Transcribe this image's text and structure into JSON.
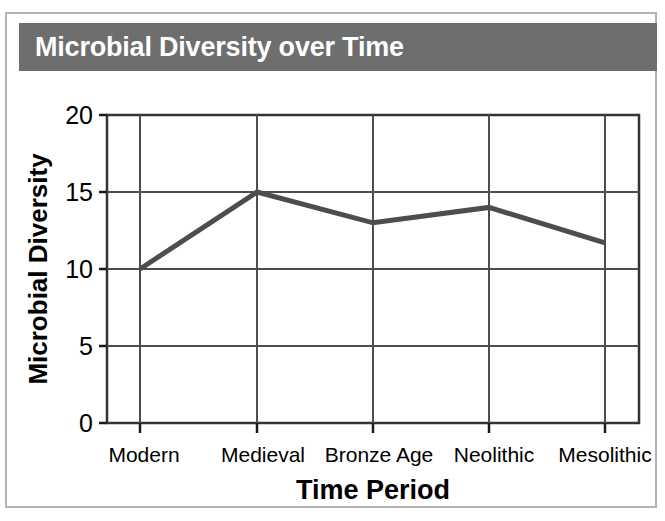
{
  "title": "Microbial Diversity over Time",
  "colors": {
    "title_bar_bg": "#6e6e6e",
    "title_text": "#ffffff",
    "line": "#4d4d4d",
    "grid": "#4d4d4d",
    "axis": "#1a1a1a",
    "card_border": "#b3b3b3",
    "background": "#ffffff"
  },
  "axes": {
    "x_label": "Time Period",
    "y_label": "Microbial Diversity",
    "y_ticks": [
      "0",
      "5",
      "10",
      "15",
      "20"
    ],
    "x_ticks": [
      "Modern",
      "Medieval",
      "Bronze Age",
      "Neolithic",
      "Mesolithic"
    ]
  },
  "chart_data": {
    "type": "line",
    "title": "Microbial Diversity over Time",
    "xlabel": "Time Period",
    "ylabel": "Microbial Diversity",
    "categories": [
      "Modern",
      "Medieval",
      "Bronze Age",
      "Neolithic",
      "Mesolithic"
    ],
    "values": [
      10,
      15,
      13,
      14,
      11.7
    ],
    "ylim": [
      0,
      20
    ],
    "yticks": [
      0,
      5,
      10,
      15,
      20
    ],
    "grid": true,
    "legend": false,
    "markers": false,
    "line_width": 5,
    "line_color": "#4d4d4d"
  }
}
